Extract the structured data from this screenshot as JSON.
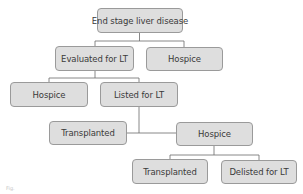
{
  "diagram": {
    "type": "tree",
    "nodes": [
      {
        "id": "esld",
        "label": "End stage liver disease"
      },
      {
        "id": "evaluated",
        "label": "Evaluated for LT"
      },
      {
        "id": "hospice1",
        "label": "Hospice"
      },
      {
        "id": "hospice2",
        "label": "Hospice"
      },
      {
        "id": "listed",
        "label": "Listed for LT"
      },
      {
        "id": "transplanted1",
        "label": "Transplanted"
      },
      {
        "id": "hospice3",
        "label": "Hospice"
      },
      {
        "id": "transplanted2",
        "label": "Transplanted"
      },
      {
        "id": "delisted",
        "label": "Delisted for LT"
      }
    ],
    "edges": [
      [
        "esld",
        "evaluated"
      ],
      [
        "esld",
        "hospice1"
      ],
      [
        "evaluated",
        "hospice2"
      ],
      [
        "evaluated",
        "listed"
      ],
      [
        "listed",
        "transplanted1"
      ],
      [
        "listed",
        "hospice3"
      ],
      [
        "hospice3",
        "transplanted2"
      ],
      [
        "hospice3",
        "delisted"
      ]
    ],
    "colors": {
      "node_fill": "#dedede",
      "node_border": "#9a9a9a",
      "line": "#6a6a6a",
      "text": "#3a3a3a"
    }
  },
  "caption": "Fig."
}
